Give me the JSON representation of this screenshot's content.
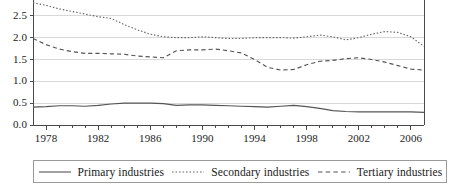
{
  "chart_data": {
    "type": "line",
    "title": "",
    "xlabel": "",
    "ylabel": "",
    "xlim": [
      1977,
      2007
    ],
    "ylim": [
      0.0,
      3.0
    ],
    "grid": true,
    "legend_position": "bottom",
    "y_ticks": [
      "0.0",
      "0.5",
      "1.0",
      "1.5",
      "2.0",
      "2.5",
      "3.0"
    ],
    "y_tick_values": [
      0.0,
      0.5,
      1.0,
      1.5,
      2.0,
      2.5,
      3.0
    ],
    "x_ticks": [
      "1978",
      "1982",
      "1986",
      "1990",
      "1994",
      "1998",
      "2002",
      "2006"
    ],
    "x_tick_values": [
      1978,
      1982,
      1986,
      1990,
      1994,
      1998,
      2002,
      2006
    ],
    "x_minor_step": 1,
    "x": [
      1977,
      1978,
      1979,
      1980,
      1981,
      1982,
      1983,
      1984,
      1985,
      1986,
      1987,
      1988,
      1989,
      1990,
      1991,
      1992,
      1993,
      1994,
      1995,
      1996,
      1997,
      1998,
      1999,
      2000,
      2001,
      2002,
      2003,
      2004,
      2005,
      2006,
      2007
    ],
    "series": [
      {
        "name": "Primary industries",
        "style": "solid",
        "color": "#555555",
        "values": [
          0.41,
          0.42,
          0.44,
          0.44,
          0.43,
          0.45,
          0.48,
          0.5,
          0.5,
          0.5,
          0.49,
          0.45,
          0.46,
          0.46,
          0.45,
          0.44,
          0.43,
          0.42,
          0.41,
          0.43,
          0.45,
          0.42,
          0.38,
          0.33,
          0.31,
          0.3,
          0.3,
          0.3,
          0.3,
          0.3,
          0.29
        ]
      },
      {
        "name": "Secondary industries",
        "style": "dotted",
        "color": "#666666",
        "values": [
          2.8,
          2.74,
          2.66,
          2.6,
          2.54,
          2.48,
          2.44,
          2.3,
          2.18,
          2.08,
          2.02,
          2.0,
          2.0,
          2.02,
          2.0,
          1.98,
          1.98,
          2.0,
          2.0,
          2.0,
          1.99,
          2.02,
          2.06,
          2.02,
          1.95,
          2.0,
          2.08,
          2.14,
          2.12,
          2.02,
          1.8
        ]
      },
      {
        "name": "Tertiary industries",
        "style": "dashed",
        "color": "#555555",
        "values": [
          1.98,
          1.84,
          1.74,
          1.68,
          1.64,
          1.64,
          1.63,
          1.62,
          1.58,
          1.56,
          1.54,
          1.7,
          1.72,
          1.72,
          1.74,
          1.7,
          1.65,
          1.5,
          1.32,
          1.26,
          1.27,
          1.38,
          1.46,
          1.48,
          1.52,
          1.54,
          1.5,
          1.44,
          1.36,
          1.28,
          1.26
        ]
      }
    ]
  },
  "legend": {
    "items": [
      {
        "label": "Primary industries"
      },
      {
        "label": "Secondary industries"
      },
      {
        "label": "Tertiary industries"
      }
    ]
  },
  "colors": {
    "axis": "#4a4a4a",
    "grid": "#d8d8d8",
    "plot_background": "#ffffff",
    "legend_border": "#9a9a9a",
    "text": "#1a1a1a"
  }
}
